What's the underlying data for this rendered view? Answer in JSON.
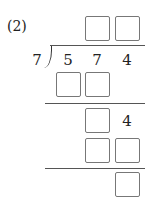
{
  "problem": {
    "label": "(2)",
    "divisor": "7",
    "dividend_digits": [
      "5",
      "7",
      "4"
    ],
    "quotient_boxes": 2,
    "steps": [
      {
        "row": "first_product",
        "boxes": 2,
        "digits": []
      },
      {
        "row": "first_remainder",
        "boxes": 1,
        "brought_down": "4"
      },
      {
        "row": "second_product",
        "boxes": 2
      },
      {
        "row": "final_remainder",
        "boxes": 1
      }
    ]
  }
}
